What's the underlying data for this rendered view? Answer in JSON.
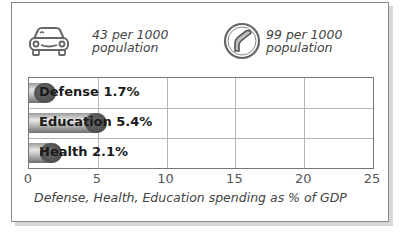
{
  "stats": [
    {
      "icon": "car-icon",
      "value_line1": "43 per 1000",
      "value_line2": "population"
    },
    {
      "icon": "phone-handset-icon",
      "value_line1": "99 per 1000",
      "value_line2": "population"
    }
  ],
  "chart_data": {
    "type": "bar",
    "orientation": "horizontal",
    "categories": [
      "Defense",
      "Education",
      "Health"
    ],
    "values": [
      1.7,
      5.4,
      2.1
    ],
    "bar_labels": [
      "Defense 1.7%",
      "Education 5.4%",
      "Health 2.1%"
    ],
    "title": "",
    "xlabel": "Defense, Health, Education spending as % of GDP",
    "ylabel": "",
    "xlim": [
      0,
      25
    ],
    "xticks": [
      "0",
      "5",
      "10",
      "15",
      "20",
      "25"
    ],
    "grid": true,
    "legend": "none"
  },
  "colors": {
    "bar_dark": "#4e4e4e",
    "bar_light": "#e8e8e8",
    "grid": "#b5b5b5",
    "text": "#444444"
  }
}
